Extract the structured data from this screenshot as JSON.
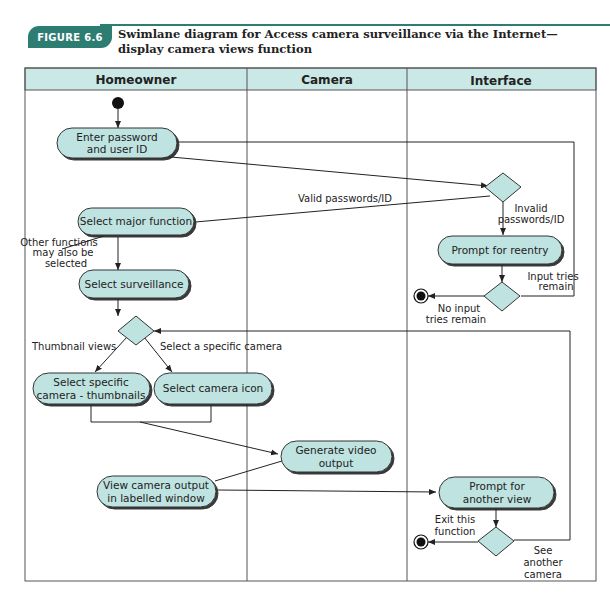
{
  "figure": {
    "badge": "FIGURE 6.6",
    "caption": "Swimlane diagram for Access camera surveillance via the Internet—display camera views function",
    "accent_color": "#2e7d72"
  },
  "lanes": [
    {
      "title": "Homeowner"
    },
    {
      "title": "Camera"
    },
    {
      "title": "Interface"
    }
  ],
  "colors": {
    "lane_header": "#c9e8e6",
    "node_fill": "#bfe3e0",
    "node_stroke": "#333333"
  },
  "nodes": {
    "enter_password": [
      "Enter password",
      "and user ID"
    ],
    "select_major": [
      "Select major function"
    ],
    "select_surveillance": [
      "Select surveillance"
    ],
    "select_thumbnails": [
      "Select specific",
      "camera - thumbnails"
    ],
    "select_camera_icon": [
      "Select camera icon"
    ],
    "generate_video": [
      "Generate video",
      "output"
    ],
    "view_camera_output": [
      "View camera output",
      "in labelled window"
    ],
    "prompt_reentry": [
      "Prompt for reentry"
    ],
    "prompt_another": [
      "Prompt for",
      "another view"
    ]
  },
  "labels": {
    "valid": "Valid passwords/ID",
    "invalid": [
      "Invalid",
      "passwords/ID"
    ],
    "input_tries_remain": [
      "Input tries",
      "remain"
    ],
    "no_input_tries": [
      "No input",
      "tries remain"
    ],
    "other_functions": [
      "Other functions",
      "may also be",
      "selected"
    ],
    "thumbnail_views": "Thumbnail views",
    "select_specific_camera": "Select a specific camera",
    "exit_function": [
      "Exit this",
      "function"
    ],
    "see_another": [
      "See",
      "another",
      "camera"
    ]
  }
}
